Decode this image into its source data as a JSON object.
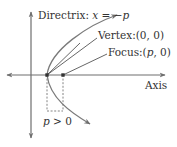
{
  "diagram": {
    "type": "parabola-definition",
    "colors": {
      "axis": "#6e6e6e",
      "curve": "#7a7a7a",
      "text": "#333333",
      "point": "#333333",
      "dashed": "#777777"
    },
    "labels": {
      "directrix_prefix": "Directrix: ",
      "directrix_var": "x",
      "directrix_eq": " = −",
      "directrix_p": "p",
      "vertex": "Vertex:(0, 0)",
      "focus_prefix": "Focus:(",
      "focus_p": "p",
      "focus_suffix": ", 0)",
      "axis": "Axis",
      "p_condition_var": "p",
      "p_condition_rest": " > 0"
    },
    "points": {
      "vertex": {
        "name": "Vertex",
        "coords": "(0, 0)"
      },
      "focus": {
        "name": "Focus",
        "coords": "(p, 0)"
      }
    }
  }
}
